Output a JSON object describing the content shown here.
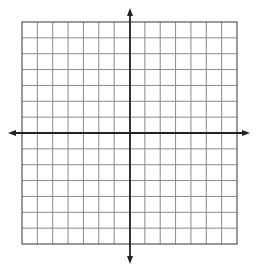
{
  "diagram": {
    "type": "coordinate-plane",
    "grid": {
      "columns": 14,
      "rows": 14,
      "left": 22,
      "top": 22,
      "right": 237,
      "bottom": 244,
      "line_color": "#8a8a8a",
      "border_color": "#555555"
    },
    "axes": {
      "x_axis_y": 133,
      "y_axis_x": 130,
      "x_extent": [
        8,
        250
      ],
      "y_extent": [
        8,
        264
      ],
      "color": "#222222",
      "arrows": [
        "left",
        "right",
        "up",
        "down"
      ]
    },
    "labels": []
  }
}
